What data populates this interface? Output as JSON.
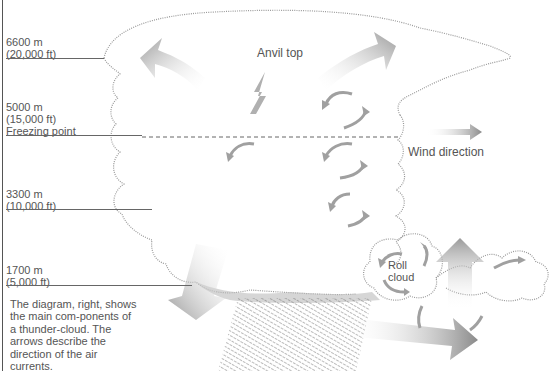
{
  "diagram": {
    "title_labels": {
      "anvil": "Anvil top",
      "wind": "Wind direction",
      "roll": "Roll\ncloud"
    },
    "altitude_markers": [
      {
        "metric": "6600 m",
        "imperial": "(20,000 ft)",
        "note": ""
      },
      {
        "metric": "5000 m",
        "imperial": "(15,000 ft)",
        "note": "Freezing point"
      },
      {
        "metric": "3300 m",
        "imperial": "(10,000 ft)",
        "note": ""
      },
      {
        "metric": "1700 m",
        "imperial": "(5,000 ft)",
        "note": ""
      }
    ],
    "caption": "The diagram, right, shows the main com-ponents of a thunder-cloud. The arrows describe the direction of the air currents.",
    "icons": [
      "lightning-bolt-icon",
      "air-current-arrow-icon",
      "wind-arrow-icon"
    ],
    "colors": {
      "arrow": "#9a9a9a",
      "outline": "#888888",
      "text": "#555555",
      "rule": "#666666"
    }
  }
}
